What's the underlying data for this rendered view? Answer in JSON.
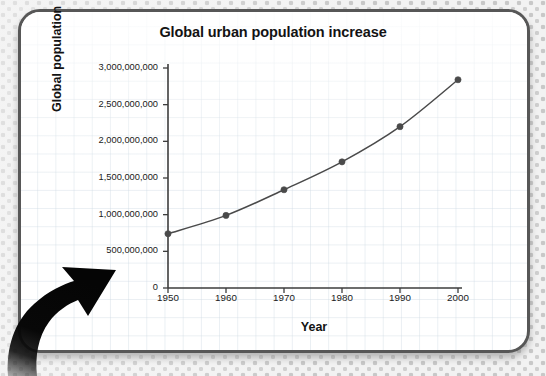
{
  "card": {
    "border_color": "#575757",
    "background": "#ffffff"
  },
  "arrow": {
    "name": "curved-up-right-arrow",
    "color": "#080808"
  },
  "chart_data": {
    "type": "line",
    "title": "Global urban population increase",
    "xlabel": "Year",
    "ylabel": "Global population",
    "x": [
      1950,
      1960,
      1970,
      1980,
      1990,
      2000
    ],
    "xtick_labels": [
      "1950",
      "1960",
      "1970",
      "1980",
      "1990",
      "2000"
    ],
    "values": [
      740000000,
      990000000,
      1340000000,
      1720000000,
      2200000000,
      2840000000
    ],
    "ytick_values": [
      0,
      500000000,
      1000000000,
      1500000000,
      2000000000,
      2500000000,
      3000000000
    ],
    "ytick_labels": [
      "0",
      "500,000,000",
      "1,000,000,000",
      "1,500,000,000",
      "2,000,000,000",
      "2,500,000,000",
      "3,000,000,000"
    ],
    "xlim": [
      1950,
      2000
    ],
    "ylim": [
      0,
      3000000000
    ],
    "grid": true,
    "legend": "none",
    "series_color": "#4a4a4a",
    "marker": "circle",
    "axis_color": "#3d3d3d"
  }
}
